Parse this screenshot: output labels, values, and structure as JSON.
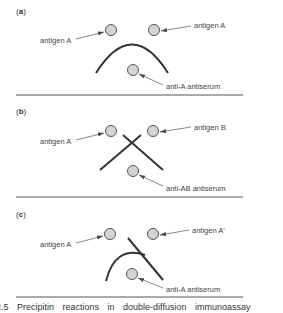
{
  "figure": {
    "panels": [
      {
        "label_open": "(",
        "label_letter": "a",
        "label_close": ")",
        "left_well_label": "antigen A",
        "right_well_label": "antigen A",
        "bottom_well_label": "anti-A antiserum",
        "reaction": "identity"
      },
      {
        "label_open": "(",
        "label_letter": "b",
        "label_close": ")",
        "left_well_label": "antigen A",
        "right_well_label": "antigen B",
        "bottom_well_label": "anti-AB antiserum",
        "reaction": "non-identity"
      },
      {
        "label_open": "(",
        "label_letter": "c",
        "label_close": ")",
        "left_well_label": "antigen A",
        "right_well_label": "antigen A′",
        "bottom_well_label": "anti-A antiserum",
        "reaction": "partial identity"
      }
    ],
    "caption": "2.5  Precipitin reactions in double-diffusion immunoassay"
  },
  "colors": {
    "well_fill": "#d4d4d4",
    "line": "#333333"
  }
}
